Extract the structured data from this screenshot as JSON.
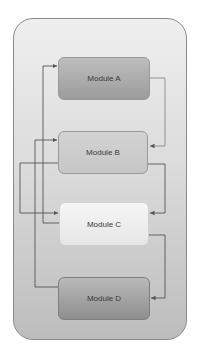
{
  "diagram": {
    "modules": [
      {
        "id": "A",
        "label": "Module A"
      },
      {
        "id": "B",
        "label": "Module B"
      },
      {
        "id": "C",
        "label": "Module C"
      },
      {
        "id": "D",
        "label": "Module D"
      }
    ],
    "connections": [
      {
        "from": "C",
        "to": "A"
      },
      {
        "from": "A",
        "to": "B"
      },
      {
        "from": "D",
        "to": "B"
      },
      {
        "from": "B",
        "to": "C"
      },
      {
        "from": "B",
        "to": "C",
        "side": "left"
      },
      {
        "from": "C",
        "to": "D"
      }
    ],
    "colors": {
      "container_top": "#efefef",
      "container_bottom": "#bdbdbd",
      "line": "#555555"
    }
  }
}
